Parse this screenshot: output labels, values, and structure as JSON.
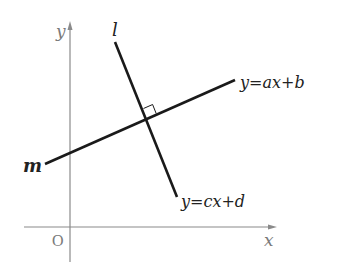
{
  "diagram": {
    "type": "coordinate-plane-perpendicular-lines",
    "colors": {
      "axis": "#8a8a8a",
      "axis_label": "#7a7a7a",
      "line": "#1a1a1a",
      "label": "#222222",
      "background": "#ffffff"
    },
    "axes": {
      "x_label": "x",
      "y_label": "y",
      "origin_label": "O"
    },
    "lines": [
      {
        "name": "m",
        "label": "m",
        "equation": "y=ax+b",
        "eq_parts": [
          "y",
          "=",
          "ax",
          "+",
          "b"
        ]
      },
      {
        "name": "l",
        "label": "l",
        "equation": "y=cx+d",
        "eq_parts": [
          "y",
          "=",
          "cx",
          "+",
          "d"
        ]
      }
    ],
    "right_angle_marker": true
  }
}
